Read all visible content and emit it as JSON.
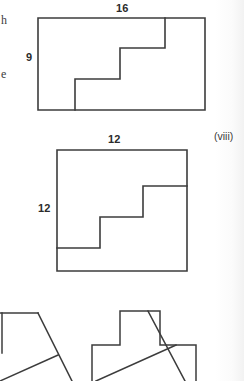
{
  "page": {
    "background_color": "#ffffff",
    "stroke_color": "#3c3c3c",
    "text_color": "#2b2b2b"
  },
  "cropped_margin_text": {
    "top_fragment": "h",
    "bottom_fragment": "e"
  },
  "item_labels": [
    {
      "text": "(viii)",
      "x": 214,
      "y": 131
    }
  ],
  "figures": [
    {
      "name": "staircase-rectangle-16-by-9",
      "shape": "staircase polygon inscribed in a rectangle",
      "width_label": "16",
      "height_label": "9",
      "width_label_pos": {
        "x": 116,
        "y": 3
      },
      "height_label_pos": {
        "x": 26,
        "y": 52
      },
      "outline_points": "38,18 205,18 205,110 38,110 38,18",
      "step_path": "M 75,110 L 75,79 L 120,79 L 120,48 L 165,48 L 165,18"
    },
    {
      "name": "staircase-square-12-by-12",
      "shape": "staircase polygon inscribed in a square",
      "width_label": "12",
      "height_label": "12",
      "width_label_pos": {
        "x": 108,
        "y": 134
      },
      "height_label_pos": {
        "x": 38,
        "y": 203
      },
      "outline_points": "57,150 187,150 187,271 57,271 57,150",
      "step_path": "M 57,248 L 100,248 L 100,217 L 143,217 L 143,186 L 187,186"
    },
    {
      "name": "partial-figure-bottom-left",
      "shape": "partially visible polygon with diagonal edges, cropped at page bottom",
      "paths": [
        "M 0,313 L 0,353",
        "M 0,313 L 22,313 L 38,313",
        "M 38,313 L 62,359 L 72,381",
        "M 38,363 L 62,359",
        "M 0,381 L 38,363"
      ]
    },
    {
      "name": "partial-figure-bottom-right",
      "shape": "cross shaped polygon crossed by two diagonal lines, cropped at page bottom",
      "outline_path": "M 120,311 L 160,311 L 160,345 L 196,345 L 196,381 M 92,381 L 92,345 L 120,345 L 120,311",
      "diagonals": [
        "M 148,311 L 185,381",
        "M 96,381 L 176,345"
      ]
    }
  ]
}
